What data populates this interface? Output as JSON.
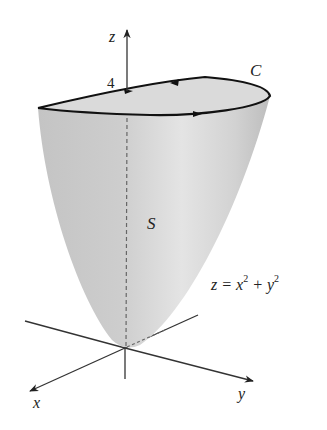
{
  "figure": {
    "labels": {
      "z_axis": "z",
      "x_axis": "x",
      "y_axis": "y",
      "height_tick": "4",
      "curve": "C",
      "surface": "S",
      "equation_lhs": "z = x",
      "equation_mid": " + y",
      "exponent": "2"
    },
    "colors": {
      "surface_fill": "#c8c8c8",
      "surface_highlight": "#e2e2e2",
      "rim_top_fill": "#d9d9d9",
      "curve_stroke": "#111111",
      "axis_stroke": "#333333",
      "dashed_stroke": "#666666",
      "background": "#ffffff"
    }
  }
}
